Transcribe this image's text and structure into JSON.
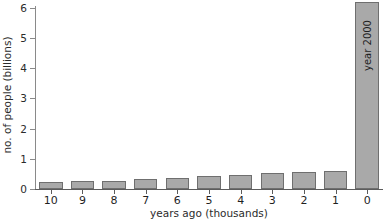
{
  "chart_data": {
    "type": "bar",
    "title": "",
    "xlabel": "years ago (thousands)",
    "ylabel": "no. of people (billions)",
    "categories": [
      "10",
      "9",
      "8",
      "7",
      "6",
      "5",
      "4",
      "3",
      "2",
      "1",
      "0"
    ],
    "values": [
      0.22,
      0.25,
      0.28,
      0.32,
      0.36,
      0.42,
      0.47,
      0.53,
      0.57,
      0.6,
      6.2
    ],
    "xlim": [
      10,
      0
    ],
    "ylim": [
      0,
      6.4
    ],
    "y_ticks": [
      0,
      1,
      2,
      3,
      4,
      5,
      6
    ],
    "y_tick_labels": [
      "0",
      "1",
      "2",
      "3",
      "4",
      "5",
      "6"
    ],
    "grid": false,
    "legend": null,
    "annotations": [
      {
        "text": "year 2000",
        "attached_to_category": "0",
        "orientation": "vertical"
      }
    ],
    "bar_fill_color": "#a9a9a9",
    "bar_edge_color": "#6f6f6f",
    "axis_color": "#5c5c5c",
    "text_color": "#1f1f1f",
    "background_color": "#ffffff"
  }
}
